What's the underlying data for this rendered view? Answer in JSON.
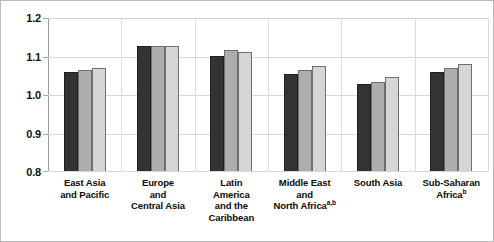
{
  "chart_data": {
    "type": "bar",
    "title": "",
    "subtitle": "",
    "xlabel": "",
    "ylabel": "",
    "ylim": [
      0.8,
      1.2
    ],
    "yticks": [
      "0.8",
      "0.9",
      "1.0",
      "1.1",
      "1.2"
    ],
    "ytick_values": [
      0.8,
      0.9,
      1.0,
      1.1,
      1.2
    ],
    "grid": "horizontal-and-group-separators",
    "legend": "none",
    "categories": [
      "East Asia and Pacific",
      "Europe and Central Asia",
      "Latin America and the Caribbean",
      "Middle East and North Africa",
      "South Asia",
      "Sub-Saharan Africa"
    ],
    "category_lines": [
      [
        "East Asia",
        "and Pacific"
      ],
      [
        "Europe",
        "and",
        "Central Asia"
      ],
      [
        "Latin",
        "America",
        "and the",
        "Caribbean"
      ],
      [
        "Middle East",
        "and",
        "North Africa"
      ],
      [
        "South Asia"
      ],
      [
        "Sub-Saharan",
        "Africa"
      ]
    ],
    "category_footnotes": [
      "",
      "",
      "",
      "a,b",
      "",
      "b"
    ],
    "series": [
      {
        "name": "series-1",
        "color": "#333333",
        "values": [
          1.056,
          1.124,
          1.1,
          1.052,
          1.025,
          1.057
        ]
      },
      {
        "name": "series-2",
        "color": "#adadad",
        "values": [
          1.062,
          1.126,
          1.114,
          1.063,
          1.032,
          1.068
        ]
      },
      {
        "name": "series-3",
        "color": "#d6d6d6",
        "values": [
          1.068,
          1.124,
          1.109,
          1.073,
          1.044,
          1.077
        ]
      }
    ]
  }
}
